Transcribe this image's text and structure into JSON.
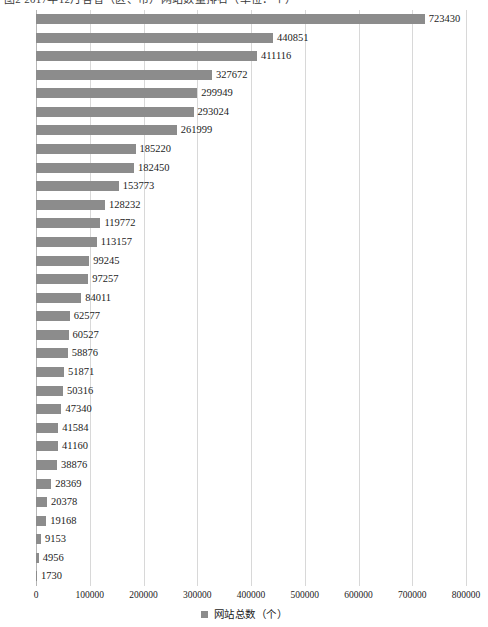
{
  "title": {
    "text": "图2 2017年12月各省（区、市）网站数量排名（单位：个）"
  },
  "legend": {
    "label": "网站总数（个）",
    "marker_color": "#8c8c8c",
    "position": "bottom-center"
  },
  "axis": {
    "x_ticks": [
      "0",
      "100000",
      "200000",
      "300000",
      "400000",
      "500000",
      "600000",
      "700000",
      "800000"
    ]
  },
  "chart_data": {
    "type": "bar",
    "orientation": "horizontal",
    "title": "图2 2017年12月各省（区、市）网站数量排名（单位：个）",
    "xlabel": "",
    "ylabel": "",
    "xlim": [
      0,
      800000
    ],
    "grid": true,
    "legend": [
      "网站总数（个）"
    ],
    "series_name": "网站总数（个）",
    "bar_color": "#8c8c8c",
    "categories": [
      "广东",
      "北京",
      "江苏",
      "上海",
      "山东",
      "浙江",
      "河南",
      "四川",
      "河北",
      "福建",
      "安徽",
      "湖北",
      "陕西",
      "辽宁",
      "湖南",
      "重庆",
      "江西",
      "广西",
      "山西",
      "云南",
      "天津",
      "贵州",
      "吉林",
      "内蒙古",
      "黑龙江",
      "海南",
      "宁夏",
      "甘肃",
      "新疆",
      "青海",
      "西藏"
    ],
    "values": [
      723430,
      440851,
      411116,
      327672,
      299949,
      293024,
      261999,
      185220,
      182450,
      153773,
      128232,
      119772,
      113157,
      99245,
      97257,
      84011,
      62577,
      60527,
      58876,
      51871,
      50316,
      47340,
      41584,
      41160,
      38876,
      28369,
      20378,
      19168,
      9153,
      4956,
      1730
    ]
  }
}
